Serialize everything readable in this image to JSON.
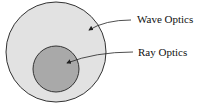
{
  "diagram": {
    "type": "venn-nested",
    "outer": {
      "label": "Wave Optics",
      "fill": "#e2e2e2"
    },
    "inner": {
      "label": "Ray Optics",
      "fill": "#a9a9a9"
    },
    "stroke": "#333333"
  }
}
